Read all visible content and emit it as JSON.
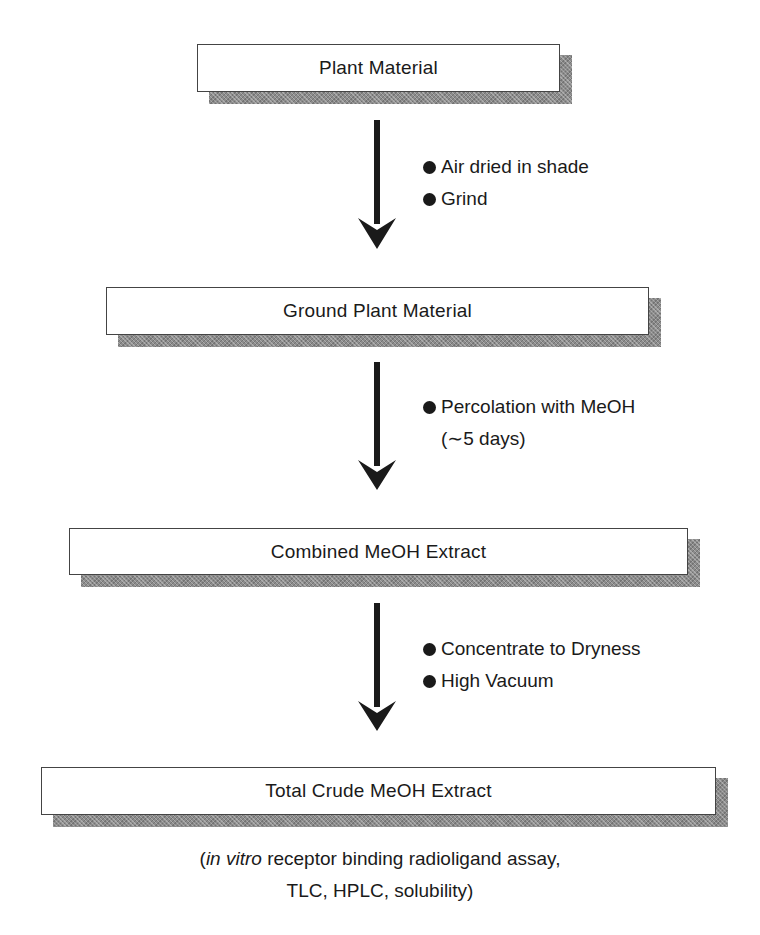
{
  "diagram": {
    "type": "flowchart",
    "boxes": [
      {
        "label": "Plant Material"
      },
      {
        "label": "Ground Plant Material"
      },
      {
        "label": "Combined MeOH Extract"
      },
      {
        "label": "Total Crude MeOH Extract"
      }
    ],
    "transitions": [
      {
        "from": "Plant Material",
        "to": "Ground Plant Material",
        "steps": [
          "Air dried in shade",
          "Grind"
        ]
      },
      {
        "from": "Ground Plant Material",
        "to": "Combined MeOH Extract",
        "steps": [
          "Percolation with MeOH"
        ],
        "step_detail": "(∼5 days)"
      },
      {
        "from": "Combined MeOH Extract",
        "to": "Total Crude MeOH Extract",
        "steps": [
          "Concentrate to Dryness",
          "High Vacuum"
        ]
      }
    ],
    "footnote": {
      "open_paren": "(",
      "italic": "in vitro",
      "line1_rest": " receptor binding radioligand assay,",
      "line2": "TLC, HPLC, solubility)"
    },
    "colors": {
      "ink": "#1a1a1a",
      "box_border": "#444444",
      "shadow": "#8c8c8c"
    }
  }
}
